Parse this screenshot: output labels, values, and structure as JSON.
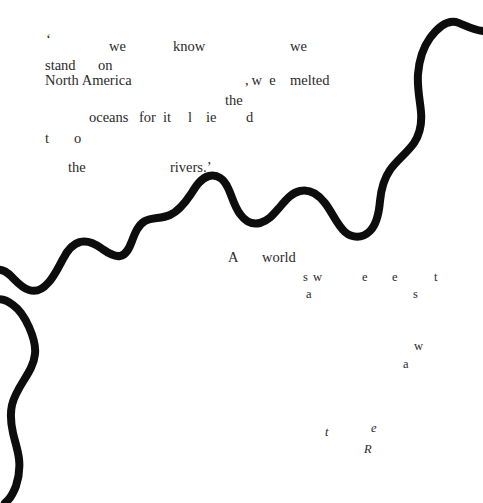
{
  "page": {
    "width": 483,
    "height": 503,
    "background_color": "#ffffff",
    "ink_color": "#2a2a2a",
    "river_color": "#0d0d0d"
  },
  "poem": {
    "full_text_reading": "' we know we stand on North America , w e melted the oceans for it l ie d t o the rivers.' A world s w e e t a s w a t e R",
    "stanza_one": [
      {
        "id": "open-quote",
        "text": "‘",
        "x": 46,
        "y": 32,
        "style": "quote"
      },
      {
        "id": "we-1",
        "text": "we",
        "x": 109,
        "y": 39,
        "style": "main"
      },
      {
        "id": "know",
        "text": "know",
        "x": 173,
        "y": 39,
        "style": "main"
      },
      {
        "id": "we-2",
        "text": "we",
        "x": 290,
        "y": 39,
        "style": "main"
      },
      {
        "id": "stand",
        "text": "stand",
        "x": 45,
        "y": 58,
        "style": "main"
      },
      {
        "id": "on",
        "text": "on",
        "x": 98,
        "y": 58,
        "style": "main"
      },
      {
        "id": "north-america",
        "text": "North America",
        "x": 45,
        "y": 73,
        "style": "main"
      },
      {
        "id": "comma-w-e",
        "text": ", w e",
        "x": 245,
        "y": 73,
        "style": "main"
      },
      {
        "id": "melted",
        "text": "melted",
        "x": 290,
        "y": 73,
        "style": "main"
      },
      {
        "id": "the-1",
        "text": "the",
        "x": 225,
        "y": 93,
        "style": "main"
      },
      {
        "id": "oceans",
        "text": "oceans",
        "x": 89,
        "y": 110,
        "style": "main"
      },
      {
        "id": "for",
        "text": "for",
        "x": 139,
        "y": 110,
        "style": "main"
      },
      {
        "id": "it",
        "text": "it",
        "x": 163,
        "y": 110,
        "style": "main"
      },
      {
        "id": "l",
        "text": "l",
        "x": 188,
        "y": 110,
        "style": "main"
      },
      {
        "id": "ie",
        "text": "ie",
        "x": 206,
        "y": 110,
        "style": "main"
      },
      {
        "id": "d",
        "text": "d",
        "x": 246,
        "y": 110,
        "style": "main"
      },
      {
        "id": "t",
        "text": "t",
        "x": 45,
        "y": 131,
        "style": "main"
      },
      {
        "id": "o",
        "text": "o",
        "x": 74,
        "y": 131,
        "style": "main"
      },
      {
        "id": "the-2",
        "text": "the",
        "x": 68,
        "y": 160,
        "style": "main"
      },
      {
        "id": "rivers",
        "text": "rivers.’",
        "x": 170,
        "y": 160,
        "style": "main"
      }
    ],
    "stanza_two": [
      {
        "id": "a-capital",
        "text": "A",
        "x": 228,
        "y": 250,
        "style": "main"
      },
      {
        "id": "world",
        "text": "world",
        "x": 262,
        "y": 250,
        "style": "main"
      },
      {
        "id": "letter-s-1",
        "text": "s",
        "x": 303,
        "y": 271,
        "style": "letter"
      },
      {
        "id": "letter-w-1",
        "text": "w",
        "x": 313,
        "y": 271,
        "style": "letter"
      },
      {
        "id": "letter-e-1",
        "text": "e",
        "x": 362,
        "y": 271,
        "style": "letter"
      },
      {
        "id": "letter-e-2",
        "text": "e",
        "x": 392,
        "y": 271,
        "style": "letter"
      },
      {
        "id": "letter-t-1",
        "text": "t",
        "x": 434,
        "y": 271,
        "style": "letter"
      },
      {
        "id": "letter-a-1",
        "text": "a",
        "x": 306,
        "y": 288,
        "style": "letter"
      },
      {
        "id": "letter-s-2",
        "text": "s",
        "x": 413,
        "y": 288,
        "style": "letter"
      },
      {
        "id": "letter-w-2",
        "text": "w",
        "x": 414,
        "y": 340,
        "style": "letter"
      },
      {
        "id": "letter-a-2",
        "text": "a",
        "x": 403,
        "y": 358,
        "style": "letter"
      },
      {
        "id": "letter-t-2",
        "text": "t",
        "x": 325,
        "y": 426,
        "style": "ital"
      },
      {
        "id": "letter-e-3",
        "text": "e",
        "x": 371,
        "y": 422,
        "style": "ital"
      },
      {
        "id": "letter-r",
        "text": "R",
        "x": 364,
        "y": 443,
        "style": "ital"
      }
    ]
  },
  "river": {
    "name": "meandering-river-line",
    "stroke_width": 8,
    "color": "#0d0d0d",
    "description": "A thick black meandering river line running diagonally from the lower-left edge to the upper-right edge of the page."
  }
}
